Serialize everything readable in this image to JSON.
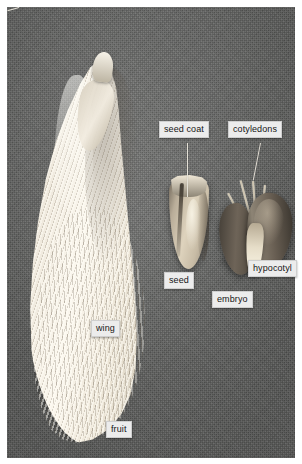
{
  "figure": {
    "kind": "labeled-botanical-photograph",
    "background_color": "#696a68",
    "plate_border_color": "#ffffff"
  },
  "specimens": [
    {
      "id": "samara",
      "name": "winged fruit (samara)",
      "color": "#f2ecdf"
    },
    {
      "id": "seed",
      "name": "seed",
      "color": "#ded3bd"
    },
    {
      "id": "embryo",
      "name": "embryo",
      "color": "#6a6054"
    }
  ],
  "labels": [
    {
      "id": "seed-coat",
      "text": "seed coat",
      "has_leader": true
    },
    {
      "id": "cotyledons",
      "text": "cotyledons",
      "has_leader": true
    },
    {
      "id": "seed",
      "text": "seed",
      "has_leader": false
    },
    {
      "id": "hypocotyl",
      "text": "hypocotyl",
      "has_leader": true
    },
    {
      "id": "embryo",
      "text": "embryo",
      "has_leader": false
    },
    {
      "id": "wing",
      "text": "wing",
      "has_leader": false
    },
    {
      "id": "fruit",
      "text": "fruit",
      "has_leader": false
    }
  ],
  "label_style": {
    "background": "#ececec",
    "text_color": "#161616",
    "leader_color": "#e4e0d6"
  }
}
